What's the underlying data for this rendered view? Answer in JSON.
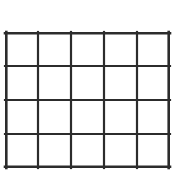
{
  "figure": {
    "kind": "grid-table",
    "title": "",
    "columns": 5,
    "rows": 4,
    "total_cells": 20,
    "cell_text": [
      [
        "",
        "",
        "",
        "",
        ""
      ],
      [
        "",
        "",
        "",
        "",
        ""
      ],
      [
        "",
        "",
        "",
        "",
        ""
      ],
      [
        "",
        "",
        "",
        "",
        ""
      ]
    ]
  },
  "geometry": {
    "canvas_width": 183,
    "canvas_height": 171,
    "grid_left": 5,
    "grid_top": 32,
    "grid_width": 165,
    "grid_height": 136,
    "column_x": [
      0,
      33,
      66,
      99,
      132,
      165
    ],
    "row_y": [
      0,
      34,
      68,
      102,
      136
    ]
  },
  "style": {
    "background_color": "#ffffff",
    "line_color": "#2c2c2c",
    "cell_fill": "#ffffff",
    "outer_line_width": 2.6,
    "inner_line_width": 2.2
  }
}
